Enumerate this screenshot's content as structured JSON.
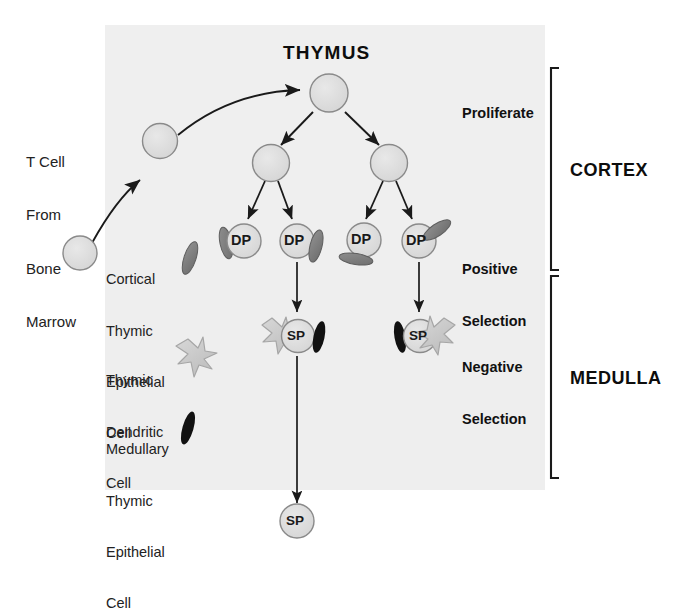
{
  "figure": {
    "title": "THYMUS",
    "background_panel_color": "#eeeeee",
    "page_background": "#ffffff"
  },
  "colors": {
    "cell_fill": "#dcdcdc",
    "cell_stroke": "#8a8a8a",
    "ctec_fill": "#7d7d7d",
    "ctec_stroke": "#5e5e5e",
    "dendritic_fill": "#cfcfcf",
    "dendritic_stroke": "#9a9a9a",
    "mtec_fill": "#111111",
    "arrow_color": "#1a1a1a",
    "bracket_color": "#1a1a1a",
    "text_color": "#1a1a1a"
  },
  "entry": {
    "label": "T Cell\nFrom\nBone\nMarrow",
    "lines": [
      "T Cell",
      "From",
      "Bone",
      "Marrow"
    ]
  },
  "legend": {
    "items": [
      {
        "label": "Cortical\nThymic\nEpithelial\nCell",
        "lines": [
          "Cortical",
          "Thymic",
          "Epithelial",
          "Cell"
        ],
        "icon": "cortical-thymic-epithelial-cell-icon"
      },
      {
        "label": "Thymic\nDendritic\nCell",
        "lines": [
          "Thymic",
          "Dendritic",
          "Cell"
        ],
        "icon": "thymic-dendritic-cell-icon"
      },
      {
        "label": "Medullary\nThymic\nEpithelial\nCell",
        "lines": [
          "Medullary",
          "Thymic",
          "Epithelial",
          "Cell"
        ],
        "icon": "medullary-thymic-epithelial-cell-icon"
      }
    ]
  },
  "stages": {
    "proliferate": "Proliferate",
    "positive_selection_line1": "Positive",
    "positive_selection_line2": "Selection",
    "negative_selection_line1": "Negative",
    "negative_selection_line2": "Selection"
  },
  "regions": {
    "cortex": "CORTEX",
    "medulla": "MEDULLA"
  },
  "cells": {
    "dp_label": "DP",
    "sp_label": "SP",
    "dp_count": 4,
    "sp_selected_count": 2,
    "output_sp_count": 1,
    "progenitor_count": 2,
    "blast_count": 3
  }
}
